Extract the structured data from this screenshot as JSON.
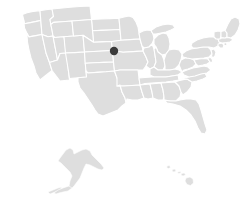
{
  "map": {
    "title": "United States choropleth map",
    "region_label": "United States",
    "projection": "albers-usa",
    "background_color": "#ffffff",
    "state_fill_color": "#dedede",
    "state_border_color": "#ffffff",
    "marker_color": "#3b3b3b",
    "includes_alaska": "true",
    "includes_hawaii": "true",
    "state_count": "50"
  },
  "markers": [
    {
      "name": "marker-north-dakota",
      "label": "North Dakota",
      "x": 114,
      "y": 51,
      "radius": 4.2,
      "color": "#3b3b3b"
    }
  ],
  "chart_data": {
    "type": "map",
    "title": "",
    "subtitle": "",
    "xlabel": "",
    "ylabel": "",
    "legend": [],
    "annotations": [
      {
        "text": "",
        "x": 114,
        "y": 51,
        "marker": "filled-circle"
      }
    ],
    "regions": [
      {
        "name": "Washington",
        "value": null,
        "fill": "#dedede"
      },
      {
        "name": "Oregon",
        "value": null,
        "fill": "#dedede"
      },
      {
        "name": "California",
        "value": null,
        "fill": "#dedede"
      },
      {
        "name": "Idaho",
        "value": null,
        "fill": "#dedede"
      },
      {
        "name": "Nevada",
        "value": null,
        "fill": "#dedede"
      },
      {
        "name": "Montana",
        "value": null,
        "fill": "#dedede"
      },
      {
        "name": "Wyoming",
        "value": null,
        "fill": "#dedede"
      },
      {
        "name": "Utah",
        "value": null,
        "fill": "#dedede"
      },
      {
        "name": "Arizona",
        "value": null,
        "fill": "#dedede"
      },
      {
        "name": "Colorado",
        "value": null,
        "fill": "#dedede"
      },
      {
        "name": "New Mexico",
        "value": null,
        "fill": "#dedede"
      },
      {
        "name": "North Dakota",
        "value": null,
        "fill": "#dedede"
      },
      {
        "name": "South Dakota",
        "value": null,
        "fill": "#dedede"
      },
      {
        "name": "Nebraska",
        "value": null,
        "fill": "#dedede"
      },
      {
        "name": "Kansas",
        "value": null,
        "fill": "#dedede"
      },
      {
        "name": "Oklahoma",
        "value": null,
        "fill": "#dedede"
      },
      {
        "name": "Texas",
        "value": null,
        "fill": "#dedede"
      },
      {
        "name": "Minnesota",
        "value": null,
        "fill": "#dedede"
      },
      {
        "name": "Iowa",
        "value": null,
        "fill": "#dedede"
      },
      {
        "name": "Missouri",
        "value": null,
        "fill": "#dedede"
      },
      {
        "name": "Arkansas",
        "value": null,
        "fill": "#dedede"
      },
      {
        "name": "Louisiana",
        "value": null,
        "fill": "#dedede"
      },
      {
        "name": "Wisconsin",
        "value": null,
        "fill": "#dedede"
      },
      {
        "name": "Illinois",
        "value": null,
        "fill": "#dedede"
      },
      {
        "name": "Michigan",
        "value": null,
        "fill": "#dedede"
      },
      {
        "name": "Indiana",
        "value": null,
        "fill": "#dedede"
      },
      {
        "name": "Ohio",
        "value": null,
        "fill": "#dedede"
      },
      {
        "name": "Kentucky",
        "value": null,
        "fill": "#dedede"
      },
      {
        "name": "Tennessee",
        "value": null,
        "fill": "#dedede"
      },
      {
        "name": "Mississippi",
        "value": null,
        "fill": "#dedede"
      },
      {
        "name": "Alabama",
        "value": null,
        "fill": "#dedede"
      },
      {
        "name": "Georgia",
        "value": null,
        "fill": "#dedede"
      },
      {
        "name": "Florida",
        "value": null,
        "fill": "#dedede"
      },
      {
        "name": "South Carolina",
        "value": null,
        "fill": "#dedede"
      },
      {
        "name": "North Carolina",
        "value": null,
        "fill": "#dedede"
      },
      {
        "name": "Virginia",
        "value": null,
        "fill": "#dedede"
      },
      {
        "name": "West Virginia",
        "value": null,
        "fill": "#dedede"
      },
      {
        "name": "Maryland",
        "value": null,
        "fill": "#dedede"
      },
      {
        "name": "Delaware",
        "value": null,
        "fill": "#dedede"
      },
      {
        "name": "Pennsylvania",
        "value": null,
        "fill": "#dedede"
      },
      {
        "name": "New Jersey",
        "value": null,
        "fill": "#dedede"
      },
      {
        "name": "New York",
        "value": null,
        "fill": "#dedede"
      },
      {
        "name": "Connecticut",
        "value": null,
        "fill": "#dedede"
      },
      {
        "name": "Rhode Island",
        "value": null,
        "fill": "#dedede"
      },
      {
        "name": "Massachusetts",
        "value": null,
        "fill": "#dedede"
      },
      {
        "name": "Vermont",
        "value": null,
        "fill": "#dedede"
      },
      {
        "name": "New Hampshire",
        "value": null,
        "fill": "#dedede"
      },
      {
        "name": "Maine",
        "value": null,
        "fill": "#dedede"
      },
      {
        "name": "Alaska",
        "value": null,
        "fill": "#dedede"
      },
      {
        "name": "Hawaii",
        "value": null,
        "fill": "#dedede"
      }
    ]
  }
}
